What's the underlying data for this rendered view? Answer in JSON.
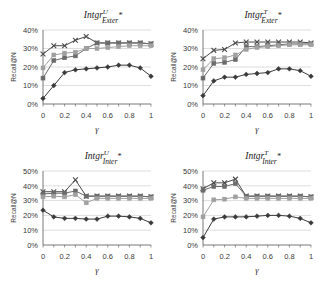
{
  "figure": {
    "panel_count": 4,
    "shared_xlabel": "γ",
    "shared_ylabel": "Recall@N"
  },
  "chart_data": [
    {
      "id": "intgr-u-exter",
      "position": "top-left",
      "type": "line",
      "title": "Intgr",
      "title_sup": "U",
      "title_sub": "Exter",
      "title_star": "*",
      "xlabel": "γ",
      "ylabel": "Recall@N",
      "x": [
        0,
        0.1,
        0.2,
        0.3,
        0.4,
        0.5,
        0.6,
        0.7,
        0.8,
        0.9,
        1
      ],
      "xtick_labels": [
        "0",
        "0.2",
        "0.4",
        "0.6",
        "0.8",
        "1"
      ],
      "xtick_values": [
        0,
        0.2,
        0.4,
        0.6,
        0.8,
        1
      ],
      "ytick_labels": [
        "0%",
        "10%",
        "20%",
        "30%",
        "40%"
      ],
      "ytick_values": [
        0,
        10,
        20,
        30,
        40
      ],
      "ylim": [
        0,
        40
      ],
      "xlim": [
        0,
        1
      ],
      "grid": true,
      "series": [
        {
          "name": "series-cross",
          "marker": "cross",
          "color": "#4a4a4a",
          "values": [
            27,
            31.5,
            31.5,
            34.5,
            36.5,
            33,
            33,
            33,
            33,
            33,
            32.5
          ]
        },
        {
          "name": "series-square-dark",
          "marker": "square",
          "color": "#6b6b6b",
          "values": [
            14,
            23.5,
            25,
            26,
            30,
            33,
            33,
            33,
            33,
            33,
            32.5
          ]
        },
        {
          "name": "series-square-light",
          "marker": "square",
          "color": "#a0a0a0",
          "values": [
            19.5,
            26.5,
            27.5,
            28,
            30,
            30,
            30.5,
            31,
            31.5,
            31.5,
            31.5
          ]
        },
        {
          "name": "series-diamond",
          "marker": "diamond",
          "color": "#3a3a3a",
          "values": [
            3,
            10,
            17,
            18.5,
            19,
            19.5,
            20,
            21,
            21,
            19.5,
            15
          ]
        }
      ]
    },
    {
      "id": "intgr-t-exter",
      "position": "top-right",
      "type": "line",
      "title": "Intgr",
      "title_sup": "T",
      "title_sub": "Exter",
      "title_star": "*",
      "xlabel": "γ",
      "ylabel": "Recall@N",
      "x": [
        0,
        0.1,
        0.2,
        0.3,
        0.4,
        0.5,
        0.6,
        0.7,
        0.8,
        0.9,
        1
      ],
      "xtick_labels": [
        "0",
        "0.2",
        "0.4",
        "0.6",
        "0.8",
        "1"
      ],
      "xtick_values": [
        0,
        0.2,
        0.4,
        0.6,
        0.8,
        1
      ],
      "ytick_labels": [
        "0%",
        "10%",
        "20%",
        "30%",
        "40%"
      ],
      "ytick_values": [
        0,
        10,
        20,
        30,
        40
      ],
      "ylim": [
        0,
        40
      ],
      "xlim": [
        0,
        1
      ],
      "grid": true,
      "series": [
        {
          "name": "series-cross",
          "marker": "cross",
          "color": "#4a4a4a",
          "values": [
            24.5,
            29,
            29.5,
            33,
            33.5,
            33.5,
            33.5,
            33.5,
            33.5,
            33.5,
            33
          ]
        },
        {
          "name": "series-square-dark",
          "marker": "square",
          "color": "#6b6b6b",
          "values": [
            14,
            22,
            22.5,
            24,
            31,
            31,
            31.5,
            32,
            32.5,
            32.5,
            32.5
          ]
        },
        {
          "name": "series-square-light",
          "marker": "square",
          "color": "#a0a0a0",
          "values": [
            18.5,
            24.5,
            25,
            26.5,
            29.5,
            30.5,
            31,
            31.5,
            32,
            32,
            32
          ]
        },
        {
          "name": "series-diamond",
          "marker": "diamond",
          "color": "#3a3a3a",
          "values": [
            4.5,
            12.5,
            14.5,
            14.5,
            16,
            16.5,
            17,
            19,
            19,
            18,
            15
          ]
        }
      ]
    },
    {
      "id": "intgr-u-inter",
      "position": "bottom-left",
      "type": "line",
      "title": "Intgr",
      "title_sup": "U",
      "title_sub": "Inter",
      "title_star": "*",
      "xlabel": "γ",
      "ylabel": "Recall@N",
      "x": [
        0,
        0.1,
        0.2,
        0.3,
        0.4,
        0.5,
        0.6,
        0.7,
        0.8,
        0.9,
        1
      ],
      "xtick_labels": [
        "0",
        "0.2",
        "0.4",
        "0.6",
        "0.8",
        "1"
      ],
      "xtick_values": [
        0,
        0.2,
        0.4,
        0.6,
        0.8,
        1
      ],
      "ytick_labels": [
        "0%",
        "10%",
        "20%",
        "30%",
        "40%",
        "50%"
      ],
      "ytick_values": [
        0,
        10,
        20,
        30,
        40,
        50
      ],
      "ylim": [
        0,
        50
      ],
      "xlim": [
        0,
        1
      ],
      "grid": true,
      "series": [
        {
          "name": "series-cross",
          "marker": "cross",
          "color": "#4a4a4a",
          "values": [
            36,
            36,
            36,
            44,
            33,
            33,
            33,
            33,
            33,
            33,
            32.5
          ]
        },
        {
          "name": "series-square-dark",
          "marker": "square",
          "color": "#6b6b6b",
          "values": [
            34.5,
            35,
            35,
            36.5,
            33,
            33,
            33,
            33,
            33,
            33,
            32.5
          ]
        },
        {
          "name": "series-square-light",
          "marker": "square",
          "color": "#a0a0a0",
          "values": [
            32.5,
            33,
            32.5,
            34,
            28.5,
            31.5,
            31.5,
            31.5,
            31.5,
            31.5,
            31.5
          ]
        },
        {
          "name": "series-diamond",
          "marker": "diamond",
          "color": "#3a3a3a",
          "values": [
            23.5,
            19,
            18,
            18,
            17.5,
            17.5,
            19.5,
            19.5,
            19,
            18,
            15
          ]
        }
      ]
    },
    {
      "id": "intgr-t-inter",
      "position": "bottom-right",
      "type": "line",
      "title": "Intgr",
      "title_sup": "T",
      "title_sub": "Inter",
      "title_star": "*",
      "xlabel": "γ",
      "ylabel": "Recall@N",
      "x": [
        0,
        0.1,
        0.2,
        0.3,
        0.4,
        0.5,
        0.6,
        0.7,
        0.8,
        0.9,
        1
      ],
      "xtick_labels": [
        "0",
        "0.2",
        "0.4",
        "0.6",
        "0.8",
        "1"
      ],
      "xtick_values": [
        0,
        0.2,
        0.4,
        0.6,
        0.8,
        1
      ],
      "ytick_labels": [
        "0%",
        "10%",
        "20%",
        "30%",
        "40%",
        "50%"
      ],
      "ytick_values": [
        0,
        10,
        20,
        30,
        40,
        50
      ],
      "ylim": [
        0,
        50
      ],
      "xlim": [
        0,
        1
      ],
      "grid": true,
      "series": [
        {
          "name": "series-cross",
          "marker": "cross",
          "color": "#4a4a4a",
          "values": [
            38,
            42,
            42,
            44.5,
            33,
            33,
            33,
            33,
            33,
            33,
            32.5
          ]
        },
        {
          "name": "series-square-dark",
          "marker": "square",
          "color": "#6b6b6b",
          "values": [
            37,
            39.5,
            39.5,
            41.5,
            33,
            33,
            33,
            33,
            33,
            33,
            32.5
          ]
        },
        {
          "name": "series-square-light",
          "marker": "square",
          "color": "#a0a0a0",
          "values": [
            19,
            30.5,
            31,
            32.5,
            31.5,
            31.5,
            31.5,
            31.5,
            31.5,
            31.5,
            31.5
          ]
        },
        {
          "name": "series-diamond",
          "marker": "diamond",
          "color": "#3a3a3a",
          "values": [
            5,
            17.5,
            19,
            19,
            19,
            19.5,
            20,
            20,
            19.5,
            18,
            15
          ]
        }
      ]
    }
  ]
}
